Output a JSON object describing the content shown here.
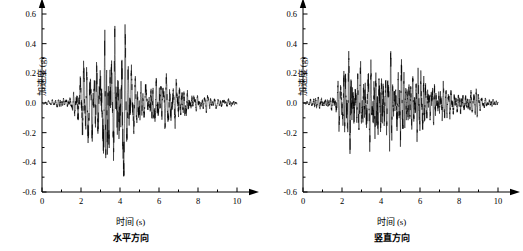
{
  "figure": {
    "background_color": "#ffffff",
    "line_color": "#000000",
    "axis_color": "#000000"
  },
  "panels": [
    {
      "id": "horizontal",
      "caption": "水平方向",
      "xlabel": "时间 (s)",
      "ylabel": "加速度 (g)"
    },
    {
      "id": "vertical",
      "caption": "竖直方向",
      "xlabel": "时间 (s)",
      "ylabel": "加速度 (g)"
    }
  ],
  "chart_data": [
    {
      "type": "line",
      "title": "",
      "subtitle": "水平方向",
      "xlabel": "时间 (s)",
      "ylabel": "加速度 (g)",
      "xlim": [
        0,
        10
      ],
      "ylim": [
        -0.6,
        0.6
      ],
      "xticks": [
        0,
        2,
        4,
        6,
        8,
        10
      ],
      "xtick_labels": [
        "0",
        "2",
        "4",
        "6",
        "8",
        "10"
      ],
      "xminorticks": [
        1,
        3,
        5,
        7,
        9
      ],
      "yticks": [
        -0.6,
        -0.4,
        -0.2,
        0.0,
        0.2,
        0.4,
        0.6
      ],
      "ytick_labels": [
        "-0.6",
        "-0.4",
        "-0.2",
        "0.0",
        "0.2",
        "0.4",
        "0.6"
      ],
      "grid": false,
      "legend": "none",
      "series": [
        {
          "name": "水平加速度时程",
          "description": "地震波加速度时程曲线，水平方向",
          "peak_positive": 0.41,
          "peak_negative": -0.53,
          "peak_time_positive": 3.95,
          "peak_time_negative": 3.25,
          "sample_rate_hz": 50,
          "duration_s": 10,
          "envelope": [
            {
              "t": 0.0,
              "a": 0.005
            },
            {
              "t": 0.5,
              "a": 0.022
            },
            {
              "t": 1.0,
              "a": 0.035
            },
            {
              "t": 1.5,
              "a": 0.045
            },
            {
              "t": 1.8,
              "a": 0.14
            },
            {
              "t": 2.2,
              "a": 0.26
            },
            {
              "t": 2.6,
              "a": 0.24
            },
            {
              "t": 3.0,
              "a": 0.33
            },
            {
              "t": 3.3,
              "a": 0.52
            },
            {
              "t": 3.6,
              "a": 0.36
            },
            {
              "t": 3.9,
              "a": 0.42
            },
            {
              "t": 4.2,
              "a": 0.46
            },
            {
              "t": 4.6,
              "a": 0.22
            },
            {
              "t": 5.0,
              "a": 0.16
            },
            {
              "t": 5.5,
              "a": 0.14
            },
            {
              "t": 6.0,
              "a": 0.17
            },
            {
              "t": 6.5,
              "a": 0.16
            },
            {
              "t": 7.0,
              "a": 0.18
            },
            {
              "t": 7.4,
              "a": 0.1
            },
            {
              "t": 8.0,
              "a": 0.055
            },
            {
              "t": 8.6,
              "a": 0.045
            },
            {
              "t": 9.2,
              "a": 0.038
            },
            {
              "t": 10.0,
              "a": 0.02
            }
          ]
        }
      ]
    },
    {
      "type": "line",
      "title": "",
      "subtitle": "竖直方向",
      "xlabel": "时间 (s)",
      "ylabel": "加速度 (g)",
      "xlim": [
        0,
        10
      ],
      "ylim": [
        -0.6,
        0.6
      ],
      "xticks": [
        0,
        2,
        4,
        6,
        8,
        10
      ],
      "xtick_labels": [
        "0",
        "2",
        "4",
        "6",
        "8",
        "10"
      ],
      "xminorticks": [
        1,
        3,
        5,
        7,
        9
      ],
      "yticks": [
        -0.6,
        -0.4,
        -0.2,
        0.0,
        0.2,
        0.4,
        0.6
      ],
      "ytick_labels": [
        "-0.6",
        "-0.4",
        "-0.2",
        "0.0",
        "0.2",
        "0.4",
        "0.6"
      ],
      "grid": false,
      "legend": "none",
      "series": [
        {
          "name": "竖直加速度时程",
          "description": "地震波加速度时程曲线，竖直方向",
          "peak_positive": 0.35,
          "peak_negative": -0.34,
          "peak_time_positive": 3.85,
          "peak_time_negative": 2.45,
          "sample_rate_hz": 50,
          "duration_s": 10,
          "envelope": [
            {
              "t": 0.0,
              "a": 0.005
            },
            {
              "t": 0.5,
              "a": 0.03
            },
            {
              "t": 1.0,
              "a": 0.04
            },
            {
              "t": 1.4,
              "a": 0.035
            },
            {
              "t": 1.8,
              "a": 0.13
            },
            {
              "t": 2.2,
              "a": 0.26
            },
            {
              "t": 2.45,
              "a": 0.34
            },
            {
              "t": 2.8,
              "a": 0.22
            },
            {
              "t": 3.2,
              "a": 0.25
            },
            {
              "t": 3.6,
              "a": 0.28
            },
            {
              "t": 3.85,
              "a": 0.35
            },
            {
              "t": 4.2,
              "a": 0.26
            },
            {
              "t": 4.6,
              "a": 0.2
            },
            {
              "t": 5.0,
              "a": 0.28
            },
            {
              "t": 5.4,
              "a": 0.16
            },
            {
              "t": 6.0,
              "a": 0.22
            },
            {
              "t": 6.5,
              "a": 0.13
            },
            {
              "t": 7.0,
              "a": 0.15
            },
            {
              "t": 7.5,
              "a": 0.09
            },
            {
              "t": 8.0,
              "a": 0.075
            },
            {
              "t": 8.6,
              "a": 0.085
            },
            {
              "t": 9.2,
              "a": 0.045
            },
            {
              "t": 10.0,
              "a": 0.018
            }
          ]
        }
      ]
    }
  ]
}
